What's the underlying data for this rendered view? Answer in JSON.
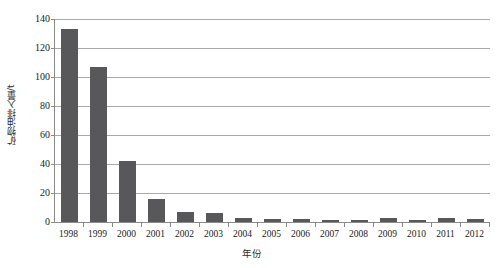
{
  "chart_data": {
    "type": "bar",
    "title": "",
    "xlabel": "年份",
    "ylabel": "矿物油排入量/t",
    "categories": [
      "1998",
      "1999",
      "2000",
      "2001",
      "2002",
      "2003",
      "2004",
      "2005",
      "2006",
      "2007",
      "2008",
      "2009",
      "2010",
      "2011",
      "2012"
    ],
    "values": [
      133,
      107,
      42,
      16,
      7,
      6,
      2.5,
      2,
      2,
      1.5,
      1.5,
      3,
      1.5,
      3,
      2
    ],
    "ylim": [
      0,
      140
    ],
    "yticks": [
      0,
      20,
      40,
      60,
      80,
      100,
      120,
      140
    ],
    "ytick_labels": [
      "0",
      "20",
      "40",
      "60",
      "80",
      "100",
      "120",
      "140"
    ],
    "grid": "horizontal",
    "legend": "none",
    "series": [
      {
        "name": "矿物油排入量",
        "color": "#58585a",
        "values": [
          133,
          107,
          42,
          16,
          7,
          6,
          2.5,
          2,
          2,
          1.5,
          1.5,
          3,
          1.5,
          3,
          2
        ]
      }
    ]
  },
  "colors": {
    "bar": "#58585a",
    "gridline": "#a9a9a9",
    "axis": "#8a8a8a",
    "text": "#1a1a1a",
    "background": "#ffffff"
  }
}
